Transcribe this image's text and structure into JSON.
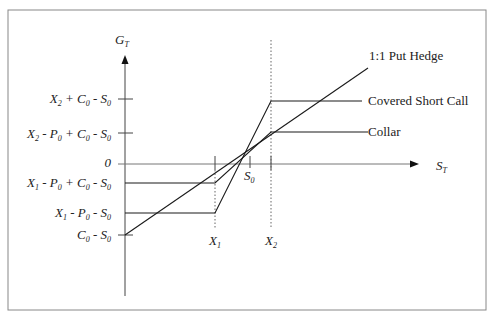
{
  "diagram": {
    "type": "payoff-diagram",
    "axes": {
      "y_label": "G",
      "y_label_sub": "T",
      "x_label": "S",
      "x_label_sub": "T"
    },
    "y_ticks": [
      {
        "id": "x2-c0-s0",
        "parts": [
          "X",
          "2",
          " + C",
          "0",
          " - S",
          "0"
        ]
      },
      {
        "id": "x2-p0-c0-s0",
        "parts": [
          "X",
          "2",
          " - P",
          "0",
          " + C",
          "0",
          " - S",
          "0"
        ]
      },
      {
        "id": "zero",
        "text": "0"
      },
      {
        "id": "x1-p0-c0-s0",
        "parts": [
          "X",
          "1",
          " - P",
          "0",
          " + C",
          "0",
          " - S",
          "0"
        ]
      },
      {
        "id": "x1-p0-s0",
        "parts": [
          "X",
          "1",
          " - P",
          "0",
          " - S",
          "0"
        ]
      },
      {
        "id": "c0-s0",
        "parts": [
          "C",
          "0",
          " - S",
          "0"
        ]
      }
    ],
    "x_ticks": [
      {
        "id": "x1",
        "main": "X",
        "sub": "1"
      },
      {
        "id": "s0",
        "main": "S",
        "sub": "0"
      },
      {
        "id": "x2",
        "main": "X",
        "sub": "2"
      }
    ],
    "legend": {
      "put_hedge": "1:1 Put Hedge",
      "covered_short_call": "Covered Short Call",
      "collar": "Collar"
    },
    "colors": {
      "line": "#1a1a1a",
      "axis": "#555555",
      "border": "#888888"
    }
  }
}
